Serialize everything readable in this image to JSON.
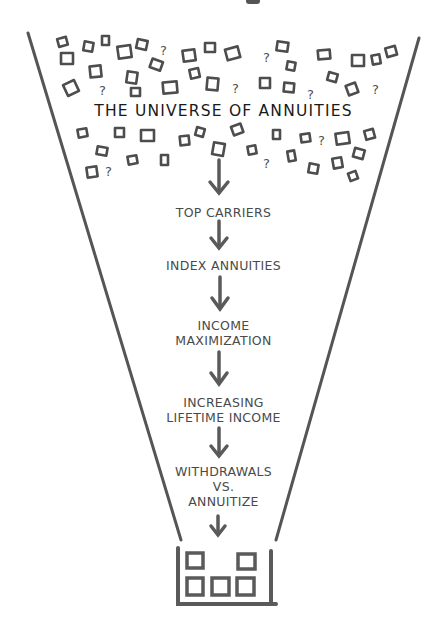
{
  "diagram": {
    "title": "THE UNIVERSE OF ANNUITIES",
    "stages": [
      {
        "lines": [
          "TOP CARRIERS"
        ]
      },
      {
        "lines": [
          "INDEX ANNUITIES"
        ]
      },
      {
        "lines": [
          "INCOME",
          "MAXIMIZATION"
        ]
      },
      {
        "lines": [
          "INCREASING",
          "LIFETIME INCOME"
        ]
      },
      {
        "lines": [
          "WITHDRAWALS",
          "VS.",
          "ANNUITIZE"
        ]
      }
    ],
    "scatter_symbols": [
      "square",
      "question-mark"
    ],
    "output_container": {
      "boxes": 5
    },
    "colors": {
      "line": "#555555",
      "text": "#4a4a4a",
      "title": "#1a1a1a",
      "background": "#ffffff"
    }
  }
}
